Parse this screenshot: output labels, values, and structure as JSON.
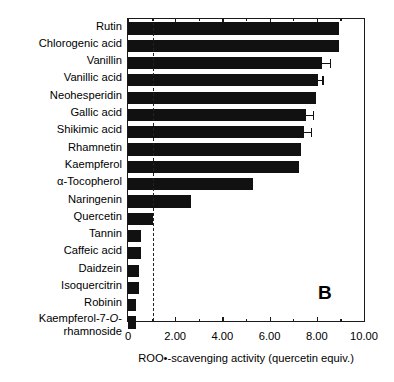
{
  "figure": {
    "panel_label": "B",
    "width": 394,
    "height": 382
  },
  "chart_data": {
    "type": "bar",
    "orientation": "horizontal",
    "title": "",
    "xlabel": "ROO•-scavenging activity (quercetin equiv.)",
    "ylabel": "",
    "xlim": [
      0,
      10
    ],
    "xticks": [
      0,
      2,
      4,
      6,
      8,
      10
    ],
    "xtick_labels": [
      "0",
      "2.00",
      "4.00",
      "6.00",
      "8.00",
      "10.00"
    ],
    "grid": false,
    "legend": null,
    "bar_color": "#111111",
    "reference_line": {
      "value": 1.05,
      "style": "dashed",
      "color": "#222222"
    },
    "categories": [
      "Rutin",
      "Chlorogenic acid",
      "Vanillin",
      "Vanillic acid",
      "Neohesperidin",
      "Gallic acid",
      "Shikimic acid",
      "Rhamnetin",
      "Kaempferol",
      "α-Tocopherol",
      "Naringenin",
      "Quercetin",
      "Tannin",
      "Caffeic acid",
      "Daidzein",
      "Isoquercitrin",
      "Robinin",
      "Kaempferol-7-O-rhamnoside"
    ],
    "values": [
      8.95,
      8.95,
      8.22,
      8.05,
      7.95,
      7.55,
      7.45,
      7.35,
      7.25,
      5.3,
      2.65,
      1.05,
      0.55,
      0.55,
      0.45,
      0.45,
      0.35,
      0.35
    ],
    "errors": [
      0,
      0,
      0.32,
      0.18,
      0,
      0.28,
      0.3,
      0,
      0,
      0,
      0,
      0,
      0,
      0,
      0,
      0,
      0,
      0
    ]
  },
  "labels": {
    "rows": [
      {
        "text": "Rutin"
      },
      {
        "text": "Chlorogenic acid"
      },
      {
        "text": "Vanillin"
      },
      {
        "text": "Vanillic acid"
      },
      {
        "text": "Neohesperidin"
      },
      {
        "text": "Gallic acid"
      },
      {
        "text": "Shikimic acid"
      },
      {
        "text": "Rhamnetin"
      },
      {
        "text": "Kaempferol"
      },
      {
        "text": "α-Tocopherol"
      },
      {
        "text": "Naringenin"
      },
      {
        "text": "Quercetin"
      },
      {
        "text": "Tannin"
      },
      {
        "text": "Caffeic acid"
      },
      {
        "text": "Daidzein"
      },
      {
        "text": "Isoquercitrin"
      },
      {
        "text": "Robinin"
      },
      {
        "text": "Kaempferol-7-O-rhamnoside"
      }
    ],
    "last_label_part1": "Kaempferol-7-",
    "last_label_italic": "O",
    "last_label_dash": "-",
    "last_label_part2": "rhamnoside"
  }
}
